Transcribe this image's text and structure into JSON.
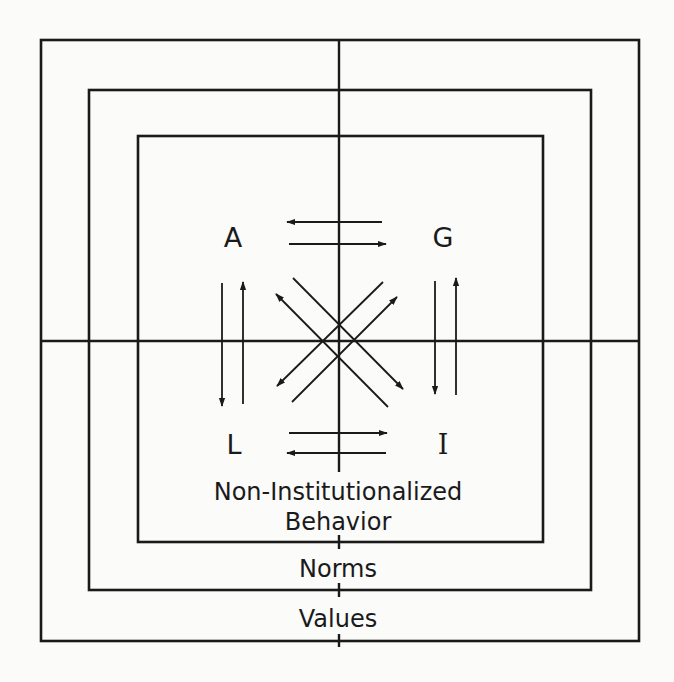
{
  "diagram": {
    "corners": {
      "top_left": "A",
      "top_right": "G",
      "bottom_left": "L",
      "bottom_right": "I"
    },
    "levels": {
      "inner_line1": "Non-Institutionalized",
      "inner_line2": "Behavior",
      "middle": "Norms",
      "outer": "Values"
    },
    "boxes": [
      {
        "name": "outer",
        "x1": 41,
        "y1": 40,
        "x2": 639,
        "y2": 641
      },
      {
        "name": "middle",
        "x1": 89,
        "y1": 90,
        "x2": 591,
        "y2": 590
      },
      {
        "name": "inner",
        "x1": 138,
        "y1": 136,
        "x2": 543,
        "y2": 542
      }
    ],
    "axes": {
      "center_x": 339,
      "center_y": 341
    },
    "arrows": [
      {
        "from": "G",
        "to": "A",
        "direction": "left"
      },
      {
        "from": "A",
        "to": "G",
        "direction": "right"
      },
      {
        "from": "L",
        "to": "I",
        "direction": "right"
      },
      {
        "from": "I",
        "to": "L",
        "direction": "left"
      },
      {
        "from": "A",
        "to": "L",
        "direction": "down"
      },
      {
        "from": "L",
        "to": "A",
        "direction": "up"
      },
      {
        "from": "G",
        "to": "I",
        "direction": "down"
      },
      {
        "from": "I",
        "to": "G",
        "direction": "up"
      },
      {
        "from": "I",
        "to": "A",
        "direction": "diagonal-up-left"
      },
      {
        "from": "A",
        "to": "I",
        "direction": "diagonal-down-right"
      },
      {
        "from": "G",
        "to": "L",
        "direction": "diagonal-down-left"
      },
      {
        "from": "L",
        "to": "G",
        "direction": "diagonal-up-right"
      }
    ],
    "colors": {
      "ink": "#1a1a1a",
      "paper": "#fbfbfa"
    }
  }
}
